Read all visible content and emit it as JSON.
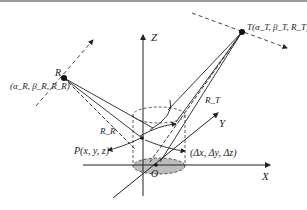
{
  "diagram": {
    "colors": {
      "line": "#222222",
      "dashed": "#333333",
      "ellipse_fill": "#bdbdbd",
      "top_bar": "#9a9a9a"
    },
    "axes": {
      "z_label": "Z",
      "y_label": "Y",
      "x_label": "X",
      "origin_label": "O"
    },
    "points": {
      "receiver": {
        "name": "R",
        "coords_label": "(α_R, β_R, R_R)"
      },
      "transmitter": {
        "name": "T",
        "coords_label": "T(α_T, β_T, R_T)"
      },
      "target": {
        "label": "P(x, y, z)"
      },
      "offset": {
        "label": "(Δx, Δy, Δz)"
      }
    },
    "ranges": {
      "receiver_range": "R_R",
      "transmitter_range": "R_T"
    }
  }
}
